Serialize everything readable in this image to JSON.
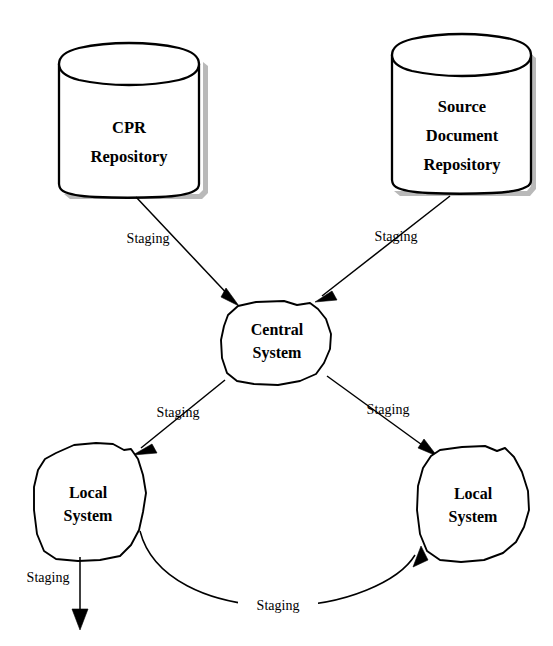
{
  "diagram": {
    "type": "flow-diagram",
    "background_color": "#ffffff",
    "line_color": "#000000",
    "shadow_color": "#b9b9b9",
    "nodes": {
      "cpr_repository": {
        "shape": "cylinder",
        "line1": "CPR",
        "line2": "Repository"
      },
      "source_document_repository": {
        "shape": "cylinder",
        "line1": "Source",
        "line2": "Document",
        "line3": "Repository"
      },
      "central_system": {
        "shape": "blob",
        "line1": "Central",
        "line2": "System"
      },
      "local_system_left": {
        "shape": "blob",
        "line1": "Local",
        "line2": "System"
      },
      "local_system_right": {
        "shape": "blob",
        "line1": "Local",
        "line2": "System"
      }
    },
    "edges": [
      {
        "id": "cpr-to-central",
        "label": "Staging",
        "from": "cpr_repository",
        "to": "central_system",
        "style": "straight-arrow"
      },
      {
        "id": "source-to-central",
        "label": "Staging",
        "from": "source_document_repository",
        "to": "central_system",
        "style": "straight-arrow"
      },
      {
        "id": "central-to-local-left",
        "label": "Staging",
        "from": "central_system",
        "to": "local_system_left",
        "style": "straight-arrow"
      },
      {
        "id": "central-to-local-right",
        "label": "Staging",
        "from": "central_system",
        "to": "local_system_right",
        "style": "straight-arrow"
      },
      {
        "id": "local-left-downstream",
        "label": "Staging",
        "from": "local_system_left",
        "to": "",
        "style": "vertical-arrow"
      },
      {
        "id": "local-left-to-local-right",
        "label": "Staging",
        "from": "local_system_left",
        "to": "local_system_right",
        "style": "curved-arrow"
      }
    ]
  }
}
